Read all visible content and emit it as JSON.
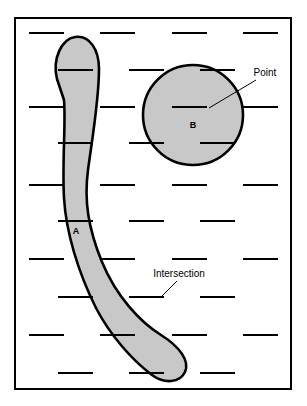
{
  "figure": {
    "name": "raster-scan-polygon-intersection-diagram",
    "frame": {
      "border_color": "#000000",
      "background_color": "#ffffff",
      "x": 14,
      "y": 17,
      "width": 278,
      "height": 373,
      "stroke_width": 2
    },
    "colors": {
      "shape_fill": "#c8c8c8",
      "shape_stroke": "#000000",
      "scanline": "#000000",
      "text": "#000000",
      "background": "#ffffff"
    },
    "regions": [
      {
        "id": "A",
        "label": "A",
        "shape": "curved-band",
        "label_x": 76,
        "label_y": 234,
        "path": "M 57 79 C 52 58 62 39 75 37 C 90 35 99 50 99 69 C 99 100 92 140 88 170 C 84 200 88 228 102 262 C 116 296 140 322 161 335 C 180 347 190 361 185 372 C 180 383 164 384 152 375 C 132 360 110 335 96 308 C 78 272 66 232 64 198 C 62 162 66 122 64 100 Z"
      },
      {
        "id": "B",
        "label": "B",
        "shape": "circle",
        "cx": 193,
        "cy": 115,
        "r": 50,
        "label_x": 193,
        "label_y": 128
      }
    ],
    "callouts": [
      {
        "id": "point",
        "label": "Point",
        "text_x": 265,
        "text_y": 76,
        "leader_from_x": 256,
        "leader_from_y": 80,
        "leader_to_x": 209,
        "leader_to_y": 108,
        "anchor": "middle"
      },
      {
        "id": "intersection",
        "label": "Intersection",
        "text_x": 179,
        "text_y": 277,
        "leader_from_x": 177,
        "leader_from_y": 281,
        "leader_to_x": 160,
        "leader_to_y": 298,
        "anchor": "middle"
      }
    ],
    "scanlines": {
      "stroke_width": 2,
      "rows": [
        {
          "y": 33,
          "dashes": [
            [
              29,
              64
            ],
            [
              100,
              135
            ],
            [
              172,
              207
            ],
            [
              243,
              278
            ]
          ]
        },
        {
          "y": 70,
          "dashes": [
            [
              58,
              93
            ],
            [
              129,
              164
            ],
            [
              200,
              235
            ]
          ]
        },
        {
          "y": 107,
          "dashes": [
            [
              29,
              64
            ],
            [
              100,
              135
            ],
            [
              172,
              207
            ],
            [
              243,
              278
            ]
          ]
        },
        {
          "y": 143,
          "dashes": [
            [
              58,
              93
            ],
            [
              129,
              164
            ],
            [
              200,
              235
            ]
          ]
        },
        {
          "y": 185,
          "dashes": [
            [
              29,
              64
            ],
            [
              100,
              135
            ],
            [
              172,
              207
            ],
            [
              243,
              278
            ]
          ]
        },
        {
          "y": 221,
          "dashes": [
            [
              58,
              93
            ],
            [
              129,
              164
            ],
            [
              200,
              235
            ]
          ]
        },
        {
          "y": 259,
          "dashes": [
            [
              29,
              64
            ],
            [
              100,
              135
            ],
            [
              172,
              207
            ],
            [
              243,
              278
            ]
          ]
        },
        {
          "y": 297,
          "dashes": [
            [
              58,
              93
            ],
            [
              129,
              164
            ],
            [
              200,
              235
            ]
          ]
        },
        {
          "y": 335,
          "dashes": [
            [
              29,
              64
            ],
            [
              100,
              135
            ],
            [
              172,
              207
            ],
            [
              243,
              278
            ]
          ]
        },
        {
          "y": 373,
          "dashes": [
            [
              58,
              93
            ],
            [
              129,
              164
            ],
            [
              200,
              235
            ]
          ]
        }
      ]
    }
  }
}
